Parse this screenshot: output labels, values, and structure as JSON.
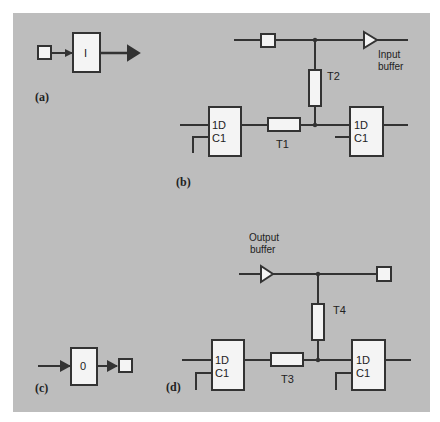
{
  "panels": {
    "a": {
      "label": "(a)",
      "cell_symbol": "I"
    },
    "b": {
      "label": "(b)",
      "buffer_label_line1": "Input",
      "buffer_label_line2": "buffer",
      "gates": {
        "t1": "T1",
        "t2": "T2"
      },
      "flipflop_left": {
        "d": "1D",
        "c": "C1"
      },
      "flipflop_right": {
        "d": "1D",
        "c": "C1"
      }
    },
    "c": {
      "label": "(c)",
      "cell_symbol": "0"
    },
    "d": {
      "label": "(d)",
      "buffer_label_line1": "Output",
      "buffer_label_line2": "buffer",
      "gates": {
        "t3": "T3",
        "t4": "T4"
      },
      "flipflop_left": {
        "d": "1D",
        "c": "C1"
      },
      "flipflop_right": {
        "d": "1D",
        "c": "C1"
      }
    }
  },
  "colors": {
    "background": "#bdbdbd",
    "stroke": "#333333",
    "fill": "#f4f4f4"
  }
}
